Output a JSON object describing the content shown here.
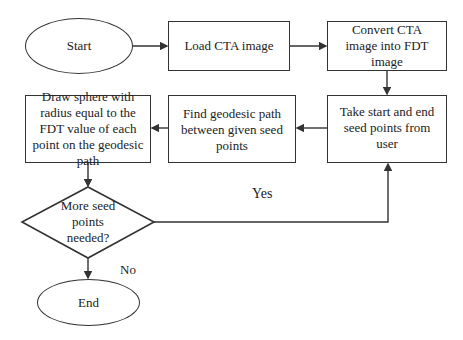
{
  "flowchart": {
    "nodes": {
      "start": {
        "label": "Start",
        "shape": "ellipse"
      },
      "load": {
        "label": "Load CTA image",
        "shape": "rect"
      },
      "convert": {
        "label": "Convert CTA image into FDT image",
        "shape": "rect"
      },
      "take_seed": {
        "label": "Take start and end seed points from user",
        "shape": "rect"
      },
      "find_path": {
        "label": "Find geodesic path between given seed points",
        "shape": "rect"
      },
      "draw_sphere": {
        "label": "Draw sphere with radius equal to the FDT value of each point on the geodesic path",
        "shape": "rect"
      },
      "decision": {
        "label": "More seed points needed?",
        "shape": "diamond"
      },
      "end": {
        "label": "End",
        "shape": "ellipse"
      }
    },
    "edges": [
      {
        "from": "start",
        "to": "load"
      },
      {
        "from": "load",
        "to": "convert"
      },
      {
        "from": "convert",
        "to": "take_seed"
      },
      {
        "from": "take_seed",
        "to": "find_path"
      },
      {
        "from": "find_path",
        "to": "draw_sphere"
      },
      {
        "from": "draw_sphere",
        "to": "decision"
      },
      {
        "from": "decision",
        "to": "take_seed",
        "label": "Yes"
      },
      {
        "from": "decision",
        "to": "end",
        "label": "No"
      }
    ],
    "edge_labels": {
      "yes": "Yes",
      "no": "No"
    }
  }
}
